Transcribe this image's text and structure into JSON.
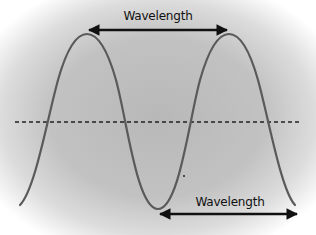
{
  "diagram": {
    "colors": {
      "background_center": "#b8b8b8",
      "wave": "#5a5a5a",
      "arrow": "#111111",
      "center_line": "#222222"
    },
    "labels": {
      "top": "Wavelength",
      "bottom": "Wavelength"
    },
    "annotations": [
      {
        "type": "double-arrow",
        "from": "peak 1",
        "to": "peak 2",
        "label": "Wavelength"
      },
      {
        "type": "double-arrow",
        "from": "trough",
        "to": "next trough",
        "label": "Wavelength"
      },
      {
        "type": "dashed-line",
        "role": "equilibrium / center line"
      }
    ]
  }
}
